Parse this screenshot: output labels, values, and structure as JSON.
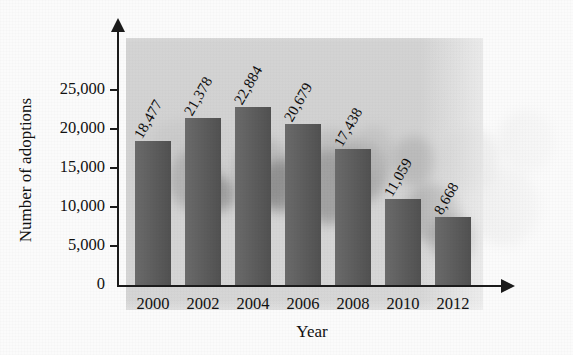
{
  "chart_data": {
    "type": "bar",
    "title": "",
    "subtitle": "",
    "xlabel": "Year",
    "ylabel": "Number of adoptions",
    "categories": [
      "2000",
      "2002",
      "2004",
      "2006",
      "2008",
      "2010",
      "2012"
    ],
    "values": [
      18477,
      21378,
      22884,
      20679,
      17438,
      11059,
      8668
    ],
    "value_labels": [
      "18,477",
      "21,378",
      "22,884",
      "20,679",
      "17,438",
      "11,059",
      "8,668"
    ],
    "ylim": [
      0,
      25000
    ],
    "ytick_values": [
      0,
      5000,
      10000,
      15000,
      20000,
      25000
    ],
    "ytick_labels": [
      "0",
      "5,000",
      "10,000",
      "15,000",
      "20,000",
      "25,000"
    ],
    "grid": false,
    "legend": false,
    "legend_position": "none",
    "bar_color": "#5a5a5a",
    "axis_color": "#1b1b1b",
    "background_color": "#fbfbfb",
    "value_label_rotation_deg": -60,
    "series": [
      {
        "name": "Number of adoptions",
        "values": [
          18477,
          21378,
          22884,
          20679,
          17438,
          11059,
          8668
        ]
      }
    ],
    "annotations": [],
    "background_image_description": "faded photograph of children behind the plot"
  },
  "axes": {
    "y_arrowhead": true,
    "x_arrowhead": true
  }
}
